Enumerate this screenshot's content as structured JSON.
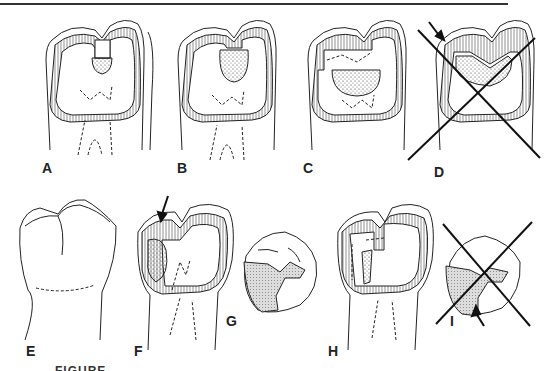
{
  "figure": {
    "panels": [
      {
        "id": "A",
        "label": "A",
        "kind": "proximal view, small occlusal cavity",
        "crossed_out": false
      },
      {
        "id": "B",
        "label": "B",
        "kind": "proximal view, larger cavity",
        "crossed_out": false
      },
      {
        "id": "C",
        "label": "C",
        "kind": "proximal view, wide preparation",
        "crossed_out": false
      },
      {
        "id": "D",
        "label": "D",
        "kind": "proximal view, incorrect preparation",
        "crossed_out": true,
        "has_arrow": true
      },
      {
        "id": "E",
        "label": "E",
        "kind": "intact tooth outline",
        "crossed_out": false
      },
      {
        "id": "F",
        "label": "F",
        "kind": "proximal view, mesial caries",
        "crossed_out": false,
        "has_arrow": true
      },
      {
        "id": "G",
        "label": "G",
        "kind": "occlusal view, restoration outline",
        "crossed_out": false
      },
      {
        "id": "H",
        "label": "H",
        "kind": "proximal view, step preparation",
        "crossed_out": false
      },
      {
        "id": "I",
        "label": "I",
        "kind": "occlusal view, incorrect outline",
        "crossed_out": true,
        "has_arrow": true
      }
    ],
    "caption_partial": "FIGURE"
  }
}
